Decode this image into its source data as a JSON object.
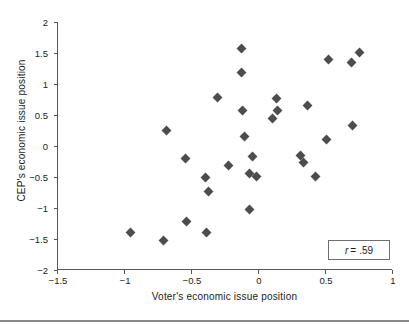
{
  "chart_data": {
    "type": "scatter",
    "title": "",
    "xlabel": "Voter's economic issue position",
    "ylabel": "CEP's economic issue position",
    "xlim": [
      -1.5,
      1
    ],
    "ylim": [
      -2,
      2
    ],
    "xticks": [
      "-1.5",
      "-1",
      "-0.5",
      "0",
      "0.5",
      "1"
    ],
    "xtick_values": [
      -1.5,
      -1,
      -0.5,
      0,
      0.5,
      1
    ],
    "yticks": [
      "2",
      "1.5",
      "1",
      "0.5",
      "0",
      "-0.5",
      "-1",
      "-1.5",
      "-2"
    ],
    "ytick_values": [
      2,
      1.5,
      1,
      0.5,
      0,
      -0.5,
      -1,
      -1.5,
      -2
    ],
    "grid": false,
    "legend": null,
    "marker": "diamond",
    "marker_color": "#4d4d4f",
    "annotations": [
      {
        "name": "correlation",
        "symbol": "r",
        "operator": "=",
        "value": ".59",
        "text": "r = .59"
      }
    ],
    "points": [
      {
        "x": -0.96,
        "y": -1.39
      },
      {
        "x": -0.71,
        "y": -1.53
      },
      {
        "x": -0.69,
        "y": 0.25
      },
      {
        "x": -0.55,
        "y": -0.2
      },
      {
        "x": -0.54,
        "y": -1.21
      },
      {
        "x": -0.4,
        "y": -0.5
      },
      {
        "x": -0.39,
        "y": -1.39
      },
      {
        "x": -0.38,
        "y": -0.74
      },
      {
        "x": -0.31,
        "y": 0.79
      },
      {
        "x": -0.23,
        "y": -0.31
      },
      {
        "x": -0.13,
        "y": 1.57
      },
      {
        "x": -0.13,
        "y": 1.18
      },
      {
        "x": -0.12,
        "y": 0.57
      },
      {
        "x": -0.11,
        "y": 0.16
      },
      {
        "x": -0.07,
        "y": -0.45
      },
      {
        "x": -0.07,
        "y": -1.03
      },
      {
        "x": -0.05,
        "y": -0.17
      },
      {
        "x": -0.02,
        "y": -0.49
      },
      {
        "x": 0.1,
        "y": 0.45
      },
      {
        "x": 0.13,
        "y": 0.76
      },
      {
        "x": 0.14,
        "y": 0.57
      },
      {
        "x": 0.31,
        "y": -0.15
      },
      {
        "x": 0.33,
        "y": -0.26
      },
      {
        "x": 0.36,
        "y": 0.65
      },
      {
        "x": 0.42,
        "y": -0.49
      },
      {
        "x": 0.5,
        "y": 0.11
      },
      {
        "x": 0.52,
        "y": 1.39
      },
      {
        "x": 0.69,
        "y": 1.34
      },
      {
        "x": 0.7,
        "y": 0.33
      },
      {
        "x": 0.75,
        "y": 1.51
      }
    ]
  }
}
